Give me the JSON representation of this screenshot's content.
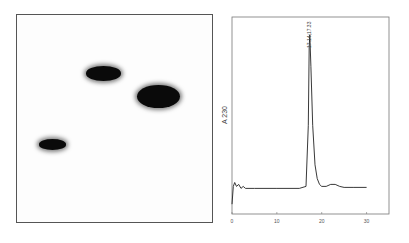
{
  "figure": {
    "left_panel": {
      "type": "2D gel / TLC image",
      "spots": [
        {
          "name": "spot-upper-middle",
          "cx_frac": 0.44,
          "cy_frac": 0.28,
          "w_frac": 0.18,
          "h_frac": 0.07,
          "intensity": "dark"
        },
        {
          "name": "spot-upper-right",
          "cx_frac": 0.72,
          "cy_frac": 0.39,
          "w_frac": 0.22,
          "h_frac": 0.11,
          "intensity": "very dark"
        },
        {
          "name": "spot-lower-left",
          "cx_frac": 0.18,
          "cy_frac": 0.62,
          "w_frac": 0.14,
          "h_frac": 0.05,
          "intensity": "dark"
        }
      ]
    }
  },
  "chart_data": {
    "type": "line",
    "title": "",
    "xlabel": "",
    "ylabel": "A 230",
    "xlim": [
      0,
      35
    ],
    "ylim": [
      0,
      1
    ],
    "xticks": [
      0,
      10,
      20,
      30
    ],
    "xtick_labels": [
      "0",
      "10",
      "20",
      "30"
    ],
    "grid": false,
    "annotations": [
      {
        "text": "17.14;17.33",
        "x": 17.3,
        "rotation": "vertical"
      }
    ],
    "series": [
      {
        "name": "A230 trace",
        "x": [
          0,
          0.3,
          0.6,
          1.0,
          1.5,
          2.0,
          2.5,
          3,
          5,
          10,
          15,
          16.5,
          17.0,
          17.2,
          17.35,
          17.6,
          18.0,
          18.5,
          19.0,
          19.5,
          20,
          21,
          22,
          23,
          24,
          25,
          27,
          30
        ],
        "y": [
          0.05,
          0.14,
          0.16,
          0.14,
          0.15,
          0.13,
          0.14,
          0.13,
          0.13,
          0.13,
          0.13,
          0.14,
          0.45,
          0.85,
          0.91,
          0.75,
          0.45,
          0.25,
          0.18,
          0.15,
          0.14,
          0.14,
          0.15,
          0.15,
          0.14,
          0.135,
          0.135,
          0.135
        ]
      }
    ]
  }
}
